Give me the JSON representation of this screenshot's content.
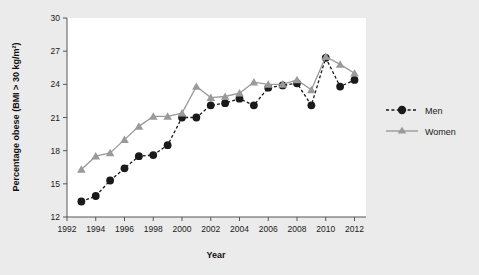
{
  "chart_data": {
    "type": "line",
    "title": "",
    "xlabel": "Year",
    "ylabel": "Percentage obese (BMI > 30 kg/m²)",
    "xlim": [
      1992,
      2012.8
    ],
    "ylim": [
      12,
      30
    ],
    "xticks": [
      1992,
      1994,
      1996,
      1998,
      2000,
      2002,
      2004,
      2006,
      2008,
      2010,
      2012
    ],
    "yticks": [
      12,
      15,
      18,
      21,
      24,
      27,
      30
    ],
    "grid": false,
    "legend_position": "right",
    "x": [
      1993,
      1994,
      1995,
      1996,
      1997,
      1998,
      1999,
      2000,
      2001,
      2002,
      2003,
      2004,
      2005,
      2006,
      2007,
      2008,
      2009,
      2010,
      2011,
      2012
    ],
    "series": [
      {
        "name": "Men",
        "color": "#1a1a1a",
        "line_style": "dashed",
        "marker": "circle",
        "values": [
          13.4,
          13.9,
          15.3,
          16.4,
          17.5,
          17.6,
          18.5,
          21.0,
          21.0,
          22.1,
          22.3,
          22.7,
          22.1,
          23.7,
          23.9,
          24.1,
          22.1,
          26.4,
          23.8,
          24.4
        ]
      },
      {
        "name": "Women",
        "color": "#9a9a9a",
        "line_style": "solid",
        "marker": "triangle",
        "values": [
          16.3,
          17.5,
          17.8,
          19.0,
          20.2,
          21.1,
          21.1,
          21.4,
          23.8,
          22.8,
          22.9,
          23.2,
          24.2,
          24.0,
          24.0,
          24.4,
          23.5,
          26.5,
          25.8,
          25.0
        ]
      }
    ]
  },
  "legend": {
    "men_label": "Men",
    "women_label": "Women"
  },
  "axes": {
    "x_title": "Year",
    "y_title": "Percentage obese (BMI > 30 kg/m²)",
    "x_tick_labels": [
      "1992",
      "1994",
      "1996",
      "1998",
      "2000",
      "2002",
      "2004",
      "2006",
      "2008",
      "2010",
      "2012"
    ],
    "y_tick_labels": [
      "12",
      "15",
      "18",
      "21",
      "24",
      "27",
      "30"
    ]
  },
  "colors": {
    "background": "#ebebeb",
    "plot_background": "#ffffff",
    "men": "#1a1a1a",
    "women": "#9a9a9a",
    "axis": "#555555"
  }
}
